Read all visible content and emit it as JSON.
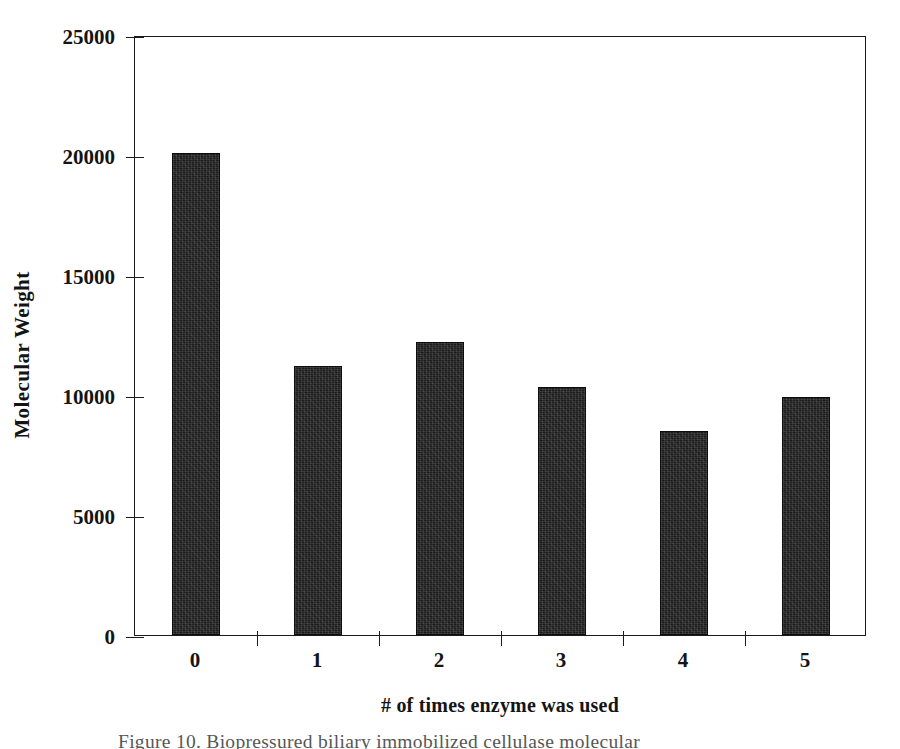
{
  "chart_data": {
    "type": "bar",
    "title": "",
    "xlabel": "# of times enzyme was used",
    "ylabel": "Molecular Weight",
    "categories": [
      "0",
      "1",
      "2",
      "3",
      "4",
      "5"
    ],
    "values": [
      20100,
      11200,
      12200,
      10350,
      8500,
      9900
    ],
    "ylim": [
      0,
      25000
    ],
    "yticks": [
      0,
      5000,
      10000,
      15000,
      20000,
      25000
    ],
    "ytick_labels": [
      "0",
      "5000",
      "10000",
      "15000",
      "20000",
      "25000"
    ],
    "xtick_labels": [
      "0",
      "1",
      "2",
      "3",
      "4",
      "5"
    ],
    "grid": false,
    "legend": false,
    "bar_color": "#1a1a1a",
    "axis_color": "#1b1b1b",
    "background": "#ffffff"
  },
  "caption": {
    "text": "Figure 10.  Biopressured biliary immobilized cellulase molecular"
  }
}
